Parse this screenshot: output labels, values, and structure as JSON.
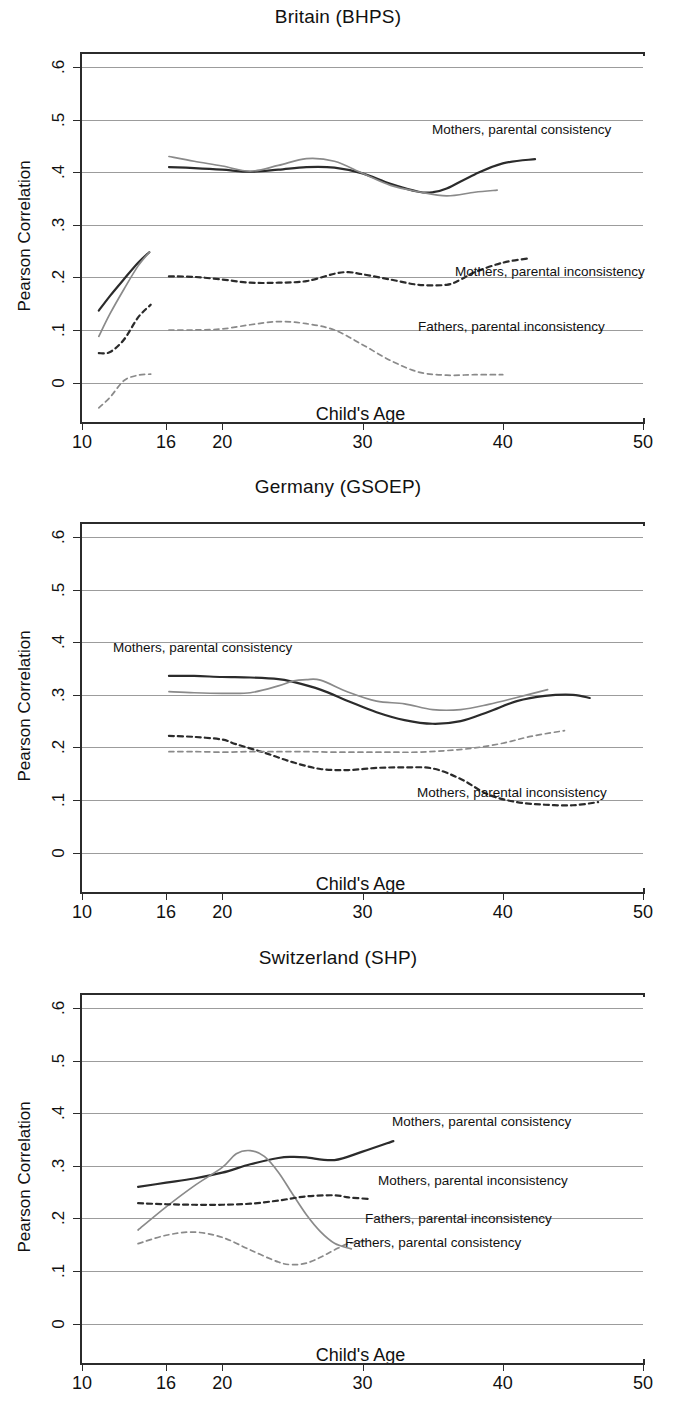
{
  "figure": {
    "y_axis_title": "Pearson Correlation",
    "x_axis_title": "Child's Age",
    "y_ticks": [
      "0",
      ".1",
      ".2",
      ".3",
      ".4",
      ".5",
      ".6"
    ],
    "x_ticks": [
      "10",
      "16",
      "20",
      "30",
      "40",
      "50"
    ],
    "colors": {
      "mothers": "#2b2b2b",
      "fathers": "#8a8a8a",
      "grid": "#9c9c9c",
      "axis": "#2b2b2b"
    }
  },
  "chart_data": [
    {
      "type": "line",
      "title": "Britain (BHPS)",
      "xlabel": "Child's Age",
      "ylabel": "Pearson Correlation",
      "xlim": [
        10,
        50
      ],
      "ylim": [
        -0.075,
        0.625
      ],
      "yticks": [
        0,
        0.1,
        0.2,
        0.3,
        0.4,
        0.5,
        0.6
      ],
      "xticks": [
        10,
        16,
        20,
        30,
        40,
        50
      ],
      "grid": true,
      "legend": "inline-annotations",
      "series": [
        {
          "name": "Mothers, parental consistency",
          "style": "solid",
          "color": "#2b2b2b",
          "label_x": 432,
          "label_y": 130,
          "x": [
            16.2,
            18,
            20,
            22,
            24,
            26,
            28,
            30,
            32,
            34,
            35,
            36,
            38,
            40,
            42.3
          ],
          "y": [
            0.41,
            0.408,
            0.405,
            0.401,
            0.405,
            0.41,
            0.409,
            0.398,
            0.378,
            0.363,
            0.362,
            0.369,
            0.396,
            0.417,
            0.425
          ]
        },
        {
          "name": "Fathers, parental consistency",
          "style": "solid",
          "color": "#8a8a8a",
          "x": [
            16.2,
            18,
            20,
            22,
            24,
            26,
            28,
            30,
            32,
            34,
            36,
            38,
            39.6
          ],
          "y": [
            0.43,
            0.421,
            0.412,
            0.402,
            0.413,
            0.426,
            0.421,
            0.398,
            0.375,
            0.363,
            0.355,
            0.362,
            0.366
          ]
        },
        {
          "name": "Mothers, parental consistency (early, ages 11-15)",
          "style": "solid",
          "color": "#2b2b2b",
          "x": [
            11.2,
            12,
            13,
            14,
            14.8
          ],
          "y": [
            0.137,
            0.165,
            0.197,
            0.228,
            0.248
          ]
        },
        {
          "name": "Fathers, parental consistency (early, ages 11-15)",
          "style": "solid",
          "color": "#8a8a8a",
          "x": [
            11.2,
            12,
            13,
            14,
            14.8
          ],
          "y": [
            0.088,
            0.131,
            0.178,
            0.222,
            0.248
          ]
        },
        {
          "name": "Mothers, parental inconsistency",
          "style": "dashed",
          "color": "#2b2b2b",
          "label_x": 455,
          "label_y": 272,
          "x": [
            16.2,
            18,
            20,
            22,
            24,
            26,
            28,
            29,
            30,
            32,
            34,
            36,
            37,
            38,
            40,
            41.8
          ],
          "y": [
            0.202,
            0.201,
            0.196,
            0.19,
            0.19,
            0.193,
            0.207,
            0.21,
            0.206,
            0.196,
            0.186,
            0.186,
            0.196,
            0.21,
            0.228,
            0.236
          ]
        },
        {
          "name": "Mothers, parental inconsistency (early, ages 11-15)",
          "style": "dashed",
          "color": "#2b2b2b",
          "x": [
            11.2,
            12,
            13,
            14,
            14.9
          ],
          "y": [
            0.056,
            0.058,
            0.082,
            0.124,
            0.148
          ]
        },
        {
          "name": "Fathers, parental inconsistency",
          "style": "dashed",
          "color": "#8a8a8a",
          "label_x": 418,
          "label_y": 327,
          "x": [
            16.2,
            18,
            20,
            22,
            24,
            26,
            28,
            30,
            32,
            34,
            36,
            38,
            40
          ],
          "y": [
            0.1,
            0.1,
            0.102,
            0.11,
            0.116,
            0.112,
            0.1,
            0.072,
            0.042,
            0.02,
            0.014,
            0.015,
            0.015
          ]
        },
        {
          "name": "Fathers, parental inconsistency (early, ages 11-15)",
          "style": "dashed",
          "color": "#8a8a8a",
          "x": [
            11.2,
            12,
            13,
            14,
            14.9
          ],
          "y": [
            -0.048,
            -0.028,
            0.004,
            0.014,
            0.016
          ]
        }
      ]
    },
    {
      "type": "line",
      "title": "Germany (GSOEP)",
      "xlabel": "Child's Age",
      "ylabel": "Pearson Correlation",
      "xlim": [
        10,
        50
      ],
      "ylim": [
        -0.075,
        0.625
      ],
      "yticks": [
        0,
        0.1,
        0.2,
        0.3,
        0.4,
        0.5,
        0.6
      ],
      "xticks": [
        10,
        16,
        20,
        30,
        40,
        50
      ],
      "grid": true,
      "legend": "inline-annotations",
      "series": [
        {
          "name": "Mothers, parental consistency",
          "style": "solid",
          "color": "#2b2b2b",
          "label_x": 113,
          "label_y": 648,
          "x": [
            16.2,
            18,
            20,
            22,
            24,
            25,
            27,
            29,
            31,
            33,
            35,
            37,
            39,
            41,
            43,
            45,
            46.2
          ],
          "y": [
            0.336,
            0.336,
            0.334,
            0.333,
            0.33,
            0.325,
            0.31,
            0.288,
            0.267,
            0.252,
            0.245,
            0.25,
            0.268,
            0.288,
            0.298,
            0.3,
            0.294
          ]
        },
        {
          "name": "Fathers, parental consistency",
          "style": "solid",
          "color": "#8a8a8a",
          "x": [
            16.2,
            18,
            20,
            22,
            24,
            25,
            26,
            27,
            29,
            31,
            33,
            35,
            37,
            39,
            41,
            43.2
          ],
          "y": [
            0.306,
            0.304,
            0.303,
            0.304,
            0.317,
            0.326,
            0.329,
            0.328,
            0.305,
            0.288,
            0.283,
            0.272,
            0.272,
            0.282,
            0.295,
            0.31
          ]
        },
        {
          "name": "Mothers, parental inconsistency",
          "style": "dashed",
          "color": "#2b2b2b",
          "label_x": 417,
          "label_y": 793,
          "x": [
            16.2,
            18,
            20,
            21,
            23,
            25,
            27,
            29,
            31,
            33,
            35,
            37,
            39,
            41,
            43,
            45,
            46.8
          ],
          "y": [
            0.222,
            0.22,
            0.215,
            0.206,
            0.19,
            0.172,
            0.159,
            0.157,
            0.161,
            0.162,
            0.16,
            0.14,
            0.11,
            0.096,
            0.091,
            0.09,
            0.096
          ]
        },
        {
          "name": "Fathers, parental inconsistency",
          "style": "dashed",
          "color": "#8a8a8a",
          "x": [
            16.2,
            18,
            20,
            22,
            24,
            26,
            28,
            30,
            32,
            34,
            36,
            38,
            40,
            42,
            44.4
          ],
          "y": [
            0.192,
            0.192,
            0.191,
            0.192,
            0.192,
            0.192,
            0.191,
            0.191,
            0.191,
            0.191,
            0.194,
            0.199,
            0.208,
            0.221,
            0.232
          ]
        }
      ]
    },
    {
      "type": "line",
      "title": "Switzerland (SHP)",
      "xlabel": "Child's Age",
      "ylabel": "Pearson Correlation",
      "xlim": [
        10,
        50
      ],
      "ylim": [
        -0.075,
        0.625
      ],
      "yticks": [
        0,
        0.1,
        0.2,
        0.3,
        0.4,
        0.5,
        0.6
      ],
      "xticks": [
        10,
        16,
        20,
        30,
        40,
        50
      ],
      "grid": true,
      "legend": "inline-annotations",
      "series": [
        {
          "name": "Mothers, parental consistency",
          "style": "solid",
          "color": "#2b2b2b",
          "label_x": 392,
          "label_y": 1122,
          "x": [
            14.0,
            16,
            18,
            20,
            22,
            24,
            25,
            26,
            28,
            30,
            32.2
          ],
          "y": [
            0.26,
            0.268,
            0.276,
            0.287,
            0.303,
            0.315,
            0.317,
            0.316,
            0.311,
            0.327,
            0.347
          ]
        },
        {
          "name": "Fathers, parental consistency",
          "style": "solid",
          "color": "#8a8a8a",
          "label_x": 345,
          "label_y": 1243,
          "x": [
            14.0,
            16,
            18,
            20,
            21,
            22,
            23,
            24,
            25,
            26,
            27,
            28,
            29.2
          ],
          "y": [
            0.178,
            0.222,
            0.262,
            0.297,
            0.323,
            0.329,
            0.318,
            0.288,
            0.247,
            0.207,
            0.175,
            0.153,
            0.142
          ]
        },
        {
          "name": "Mothers, parental inconsistency",
          "style": "dashed",
          "color": "#2b2b2b",
          "label_x": 378,
          "label_y": 1181,
          "x": [
            14.0,
            16,
            18,
            20,
            22,
            24,
            26,
            28,
            29,
            30.5
          ],
          "y": [
            0.229,
            0.227,
            0.226,
            0.226,
            0.228,
            0.234,
            0.242,
            0.244,
            0.24,
            0.237
          ]
        },
        {
          "name": "Fathers, parental inconsistency",
          "style": "dashed",
          "color": "#8a8a8a",
          "label_x": 365,
          "label_y": 1219,
          "x": [
            14.0,
            16,
            18,
            20,
            22,
            24,
            25,
            26,
            27,
            28,
            29,
            30.5
          ],
          "y": [
            0.152,
            0.168,
            0.174,
            0.164,
            0.14,
            0.117,
            0.112,
            0.115,
            0.126,
            0.14,
            0.152,
            0.158
          ]
        }
      ]
    }
  ]
}
